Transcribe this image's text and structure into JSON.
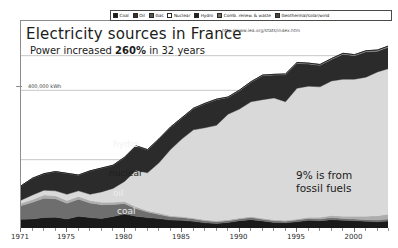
{
  "chart_data": {
    "type": "area",
    "title": "Electricity sources in France",
    "subtitle_prefix": "Power increased ",
    "subtitle_highlight": "260%",
    "subtitle_suffix": " in 32 years",
    "source_url": "http://www.iea.org/stats/index.htm",
    "xlabel": "",
    "ylabel": "400,000 kWh",
    "y_tick_labels": [
      "400,000 kWh"
    ],
    "y_tick_values": [
      400000
    ],
    "ylim": [
      0,
      600000
    ],
    "xlim": [
      1971,
      2003
    ],
    "grid": true,
    "legend_position": "top",
    "stacked": true,
    "annotation": {
      "line1": "9% is from",
      "line2": "fossil fuels"
    },
    "inline_series_labels": [
      {
        "name": "hydro",
        "label": "hydro"
      },
      {
        "name": "nuclear",
        "label": "nuclear"
      },
      {
        "name": "oil",
        "label": "oil"
      },
      {
        "name": "coal",
        "label": "coal"
      }
    ],
    "x_tick_labels": [
      "1971",
      "1975",
      "1980",
      "1985",
      "1990",
      "1995",
      "2000"
    ],
    "x_tick_values": [
      1971,
      1975,
      1980,
      1985,
      1990,
      1995,
      2000
    ],
    "categories": [
      1971,
      1972,
      1973,
      1974,
      1975,
      1976,
      1977,
      1978,
      1979,
      1980,
      1981,
      1982,
      1983,
      1984,
      1985,
      1986,
      1987,
      1988,
      1989,
      1990,
      1991,
      1992,
      1993,
      1994,
      1995,
      1996,
      1997,
      1998,
      1999,
      2000,
      2001,
      2002,
      2003
    ],
    "series": [
      {
        "name": "Coal",
        "color": "#1a1a1a",
        "values": [
          28000,
          29000,
          33000,
          34000,
          29000,
          37000,
          33000,
          30000,
          36000,
          43000,
          37000,
          33000,
          30000,
          26000,
          25000,
          22000,
          18000,
          16000,
          19000,
          24000,
          27000,
          23000,
          19000,
          18000,
          21000,
          25000,
          24000,
          27000,
          25000,
          24000,
          22000,
          21000,
          23000
        ]
      },
      {
        "name": "Oil",
        "color": "#6e6e6e",
        "values": [
          39000,
          48000,
          56000,
          53000,
          45000,
          49000,
          42000,
          40000,
          35000,
          30000,
          22000,
          16000,
          12000,
          9000,
          8000,
          7000,
          6000,
          5000,
          5000,
          5000,
          6000,
          5000,
          5000,
          4000,
          5000,
          5000,
          5000,
          6000,
          5000,
          5000,
          5000,
          5000,
          6000
        ]
      },
      {
        "name": "Gas",
        "color": "#adadad",
        "values": [
          7000,
          8000,
          9000,
          9000,
          8000,
          8000,
          7000,
          7000,
          6000,
          6000,
          5000,
          4000,
          4000,
          3000,
          3000,
          3000,
          3000,
          3000,
          3000,
          3000,
          3000,
          3000,
          3000,
          3000,
          3000,
          4000,
          5000,
          6000,
          7000,
          8000,
          10000,
          12000,
          14000
        ]
      },
      {
        "name": "Nuclear",
        "color": "#d9d9d9",
        "values": [
          9000,
          13000,
          14000,
          14000,
          18000,
          16000,
          18000,
          30000,
          40000,
          58000,
          105000,
          109000,
          145000,
          191000,
          224000,
          254000,
          265000,
          275000,
          304000,
          314000,
          331000,
          342000,
          351000,
          342000,
          377000,
          378000,
          376000,
          388000,
          395000,
          395000,
          401000,
          415000,
          420000
        ]
      },
      {
        "name": "Hydro",
        "color": "#2b2b2b",
        "values": [
          41000,
          48000,
          47000,
          55000,
          60000,
          45000,
          67000,
          68000,
          66000,
          69000,
          70000,
          66000,
          68000,
          64000,
          60000,
          61000,
          69000,
          74000,
          48000,
          53000,
          56000,
          69000,
          66000,
          78000,
          72000,
          64000,
          62000,
          62000,
          72000,
          68000,
          73000,
          60000,
          62000
        ]
      },
      {
        "name": "Comb. renew. & waste",
        "color": "#8f8f8f",
        "values": [
          500,
          500,
          600,
          600,
          600,
          700,
          700,
          800,
          900,
          900,
          1000,
          1000,
          1100,
          1200,
          1300,
          1400,
          1500,
          1600,
          1700,
          1800,
          1900,
          2000,
          2100,
          2200,
          2300,
          2400,
          2500,
          2600,
          2700,
          2800,
          2900,
          3000,
          3100
        ]
      },
      {
        "name": "Geothermal/solar/wind",
        "color": "#5c5c5c",
        "values": [
          0,
          0,
          0,
          0,
          0,
          0,
          0,
          0,
          0,
          0,
          0,
          0,
          0,
          0,
          0,
          0,
          0,
          0,
          0,
          0,
          0,
          0,
          0,
          100,
          100,
          100,
          100,
          100,
          200,
          200,
          300,
          400,
          500
        ]
      }
    ]
  },
  "legend": {
    "items": [
      {
        "label": "Coal",
        "color": "#1a1a1a"
      },
      {
        "label": "Oil",
        "color": "#333333"
      },
      {
        "label": "Gas",
        "color": "#555555"
      },
      {
        "label": "Nuclear",
        "color": "#ffffff"
      },
      {
        "label": "Hydro",
        "color": "#222222"
      },
      {
        "label": "Comb. renew. & waste",
        "color": "#6a6a6a"
      },
      {
        "label": "Geothermal/solar/wind",
        "color": "#444444"
      }
    ]
  }
}
